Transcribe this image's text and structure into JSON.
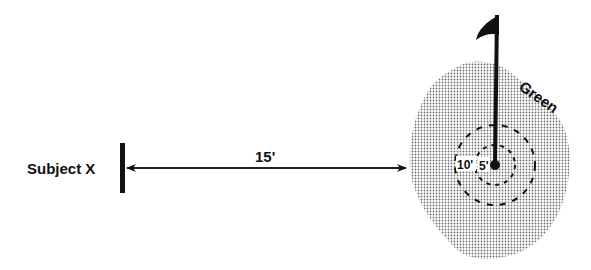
{
  "diagram": {
    "subject_label": "Subject X",
    "distance_label": "15'",
    "green_label": "Green",
    "outer_ring_label": "10'",
    "inner_ring_label": "5'",
    "colors": {
      "ink": "#111111",
      "green_dots": "#8a8a8a",
      "background": "#ffffff"
    }
  }
}
